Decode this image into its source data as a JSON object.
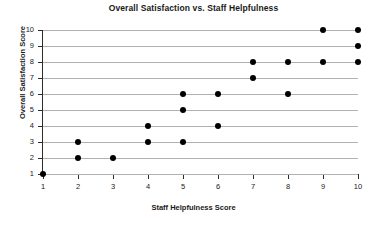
{
  "chart_data": {
    "type": "scatter",
    "title": "Overall Satisfaction vs. Staff Helpfulness",
    "xlabel": "Staff Helpfulness Score",
    "ylabel": "Overall Satisfaction Score",
    "xlim": [
      1,
      10
    ],
    "ylim": [
      1,
      10
    ],
    "xticks": [
      1,
      2,
      3,
      4,
      5,
      6,
      7,
      8,
      9,
      10
    ],
    "yticks": [
      1,
      2,
      3,
      4,
      5,
      6,
      7,
      8,
      9,
      10
    ],
    "grid": "horizontal",
    "legend": null,
    "marker": {
      "shape": "circle",
      "color": "#000000",
      "size": 6
    },
    "points": [
      {
        "x": 1,
        "y": 1
      },
      {
        "x": 2,
        "y": 2
      },
      {
        "x": 3,
        "y": 2
      },
      {
        "x": 2,
        "y": 3
      },
      {
        "x": 4,
        "y": 3
      },
      {
        "x": 5,
        "y": 3
      },
      {
        "x": 4,
        "y": 4
      },
      {
        "x": 6,
        "y": 4
      },
      {
        "x": 5,
        "y": 5
      },
      {
        "x": 5,
        "y": 6
      },
      {
        "x": 6,
        "y": 6
      },
      {
        "x": 8,
        "y": 6
      },
      {
        "x": 7,
        "y": 7
      },
      {
        "x": 7,
        "y": 8
      },
      {
        "x": 8,
        "y": 8
      },
      {
        "x": 9,
        "y": 8
      },
      {
        "x": 10,
        "y": 8
      },
      {
        "x": 10,
        "y": 9
      },
      {
        "x": 9,
        "y": 10
      },
      {
        "x": 10,
        "y": 10
      }
    ]
  }
}
